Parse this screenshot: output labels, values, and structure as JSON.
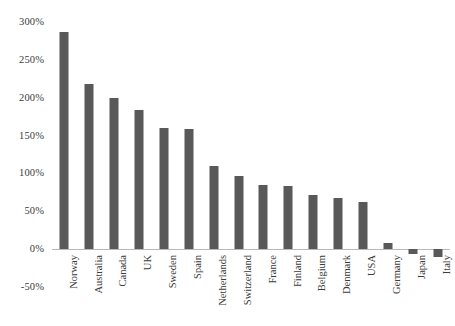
{
  "chart_data": {
    "type": "bar",
    "title": "",
    "subtitle": "",
    "xlabel": "",
    "ylabel": "",
    "legend": [],
    "legend_position": "none",
    "grid": false,
    "orientation": "vertical",
    "ylim": [
      -50,
      300
    ],
    "ytick_step": 50,
    "ytick_labels": [
      "300%",
      "250%",
      "200%",
      "150%",
      "100%",
      "50%",
      "0%",
      "-50%"
    ],
    "ytick_values": [
      300,
      250,
      200,
      150,
      100,
      50,
      0,
      -50
    ],
    "value_suffix": "%",
    "categories": [
      "Norway",
      "Australia",
      "Canada",
      "UK",
      "Sweden",
      "Spain",
      "Netherlands",
      "Switzerland",
      "France",
      "Finland",
      "Belgium",
      "Denmark",
      "USA",
      "Germany",
      "Japan",
      "Italy"
    ],
    "values": [
      287,
      218,
      200,
      184,
      160,
      159,
      110,
      96,
      85,
      83,
      72,
      68,
      62,
      8,
      -6,
      -10
    ],
    "bar_color": "#595959",
    "axis_color": "#b9b9b9",
    "text_color": "#3a3a3a",
    "background_color": "#ffffff"
  }
}
